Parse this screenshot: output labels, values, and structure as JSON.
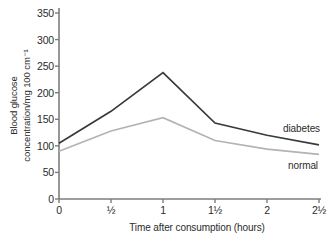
{
  "chart_data": {
    "type": "line",
    "title": "",
    "xlabel": "Time after consumption (hours)",
    "ylabel": "Blood glucose concentration/mg 100 cm⁻¹",
    "ylabel_line1": "Blood glucose",
    "ylabel_line2": "concentration/mg 100 cm⁻¹",
    "x": [
      0,
      0.5,
      1,
      1.5,
      2,
      2.5
    ],
    "categories": [
      "0",
      "½",
      "1",
      "1½",
      "2",
      "2½"
    ],
    "xlim": [
      0,
      2.5
    ],
    "ylim": [
      0,
      350
    ],
    "yticks": [
      0,
      50,
      100,
      150,
      200,
      250,
      300,
      350
    ],
    "ytick_labels": [
      "0",
      "50",
      "100",
      "150",
      "200",
      "250",
      "300",
      "350"
    ],
    "grid": false,
    "legend_position": "inline-right",
    "series": [
      {
        "name": "diabetes",
        "color": "#3a3a3a",
        "values": [
          105,
          165,
          238,
          143,
          120,
          102
        ]
      },
      {
        "name": "normal",
        "color": "#b3b3b3",
        "values": [
          90,
          128,
          153,
          110,
          94,
          84
        ]
      }
    ]
  },
  "axes": {
    "axis_color": "#7d7d7d",
    "tick_color": "#7d7d7d"
  }
}
